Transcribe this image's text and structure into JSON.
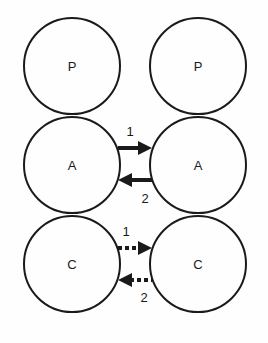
{
  "diagram": {
    "columns": [
      "left",
      "right"
    ],
    "rows": [
      {
        "left": {
          "label": "P"
        },
        "right": {
          "label": "P"
        }
      },
      {
        "left": {
          "label": "A"
        },
        "right": {
          "label": "A"
        },
        "arrows": {
          "style": "solid",
          "forward_label": "1",
          "backward_label": "2"
        }
      },
      {
        "left": {
          "label": "C"
        },
        "right": {
          "label": "C"
        },
        "arrows": {
          "style": "dashed",
          "forward_label": "1",
          "backward_label": "2"
        }
      }
    ]
  },
  "colors": {
    "stroke": "#1a1a1a",
    "background": "#fefefe"
  }
}
